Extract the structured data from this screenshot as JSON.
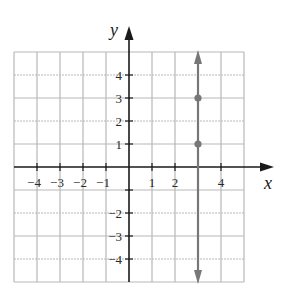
{
  "chart_data": {
    "type": "line",
    "title": "",
    "xlabel": "x",
    "ylabel": "y",
    "xlim": [
      -5,
      5
    ],
    "ylim": [
      -5,
      5
    ],
    "grid": true,
    "x_tick_labels": [
      "-4",
      "-3",
      "-2",
      "-1",
      "1",
      "2",
      "4"
    ],
    "y_tick_labels": [
      "4",
      "3",
      "2",
      "1",
      "-2",
      "-3",
      "-4"
    ],
    "series": [
      {
        "name": "x = 3",
        "kind": "vertical-line",
        "x": 3,
        "arrows": "both",
        "color": "#777777"
      }
    ],
    "points": [
      {
        "x": 3,
        "y": 3
      },
      {
        "x": 3,
        "y": 1
      }
    ],
    "colors": {
      "grid": "#b8b8b8",
      "axis": "#1a1a1a",
      "line": "#777777"
    }
  },
  "labels": {
    "x_axis": "x",
    "y_axis": "y"
  }
}
